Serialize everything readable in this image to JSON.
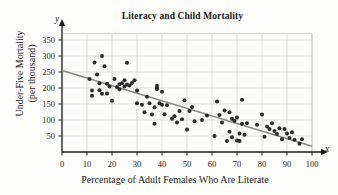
{
  "chart_data": {
    "type": "scatter",
    "title": "Literacy and Child Mortality",
    "xlabel": "Percentage of Adult Females Who Are Literate",
    "ylabel": "Under-Five Mortality",
    "ylabel_line2": "(per thousand)",
    "x_axis_symbol": "x",
    "y_axis_symbol": "y",
    "xlim": [
      0,
      100
    ],
    "ylim": [
      0,
      370
    ],
    "xticks": [
      0,
      10,
      20,
      30,
      40,
      50,
      60,
      70,
      80,
      90,
      100
    ],
    "yticks": [
      50,
      100,
      150,
      200,
      250,
      300,
      350
    ],
    "grid": true,
    "legend": "none",
    "point_color": "#2b2b2b",
    "line_color": "#8b8b8b",
    "trendline": {
      "label": "least-squares regression line",
      "x0": 0,
      "y0": 255,
      "x1": 100,
      "y1": 18
    },
    "points": [
      [
        11,
        228
      ],
      [
        12,
        176
      ],
      [
        12,
        192
      ],
      [
        13,
        280
      ],
      [
        14,
        242
      ],
      [
        15,
        193
      ],
      [
        15,
        215
      ],
      [
        16,
        300
      ],
      [
        16,
        182
      ],
      [
        17,
        268
      ],
      [
        18,
        213
      ],
      [
        18,
        183
      ],
      [
        19,
        205
      ],
      [
        20,
        160
      ],
      [
        21,
        228
      ],
      [
        22,
        203
      ],
      [
        23,
        196
      ],
      [
        23,
        212
      ],
      [
        24,
        215
      ],
      [
        25,
        224
      ],
      [
        25,
        205
      ],
      [
        26,
        279
      ],
      [
        26,
        211
      ],
      [
        27,
        208
      ],
      [
        28,
        216
      ],
      [
        29,
        224
      ],
      [
        30,
        192
      ],
      [
        30,
        152
      ],
      [
        32,
        148
      ],
      [
        33,
        124
      ],
      [
        34,
        173
      ],
      [
        35,
        152
      ],
      [
        36,
        117
      ],
      [
        37,
        88
      ],
      [
        37,
        140
      ],
      [
        38,
        207
      ],
      [
        38,
        200
      ],
      [
        38,
        196
      ],
      [
        39,
        152
      ],
      [
        40,
        188
      ],
      [
        40,
        148
      ],
      [
        41,
        118
      ],
      [
        42,
        146
      ],
      [
        44,
        104
      ],
      [
        45,
        112
      ],
      [
        46,
        92
      ],
      [
        47,
        128
      ],
      [
        48,
        102
      ],
      [
        49,
        162
      ],
      [
        50,
        70
      ],
      [
        51,
        128
      ],
      [
        52,
        141
      ],
      [
        53,
        96
      ],
      [
        56,
        100
      ],
      [
        58,
        114
      ],
      [
        61,
        50
      ],
      [
        62,
        158
      ],
      [
        63,
        116
      ],
      [
        64,
        92
      ],
      [
        65,
        130
      ],
      [
        66,
        34
      ],
      [
        67,
        63
      ],
      [
        67,
        124
      ],
      [
        68,
        46
      ],
      [
        68,
        104
      ],
      [
        69,
        98
      ],
      [
        70,
        36
      ],
      [
        70,
        108
      ],
      [
        71,
        58
      ],
      [
        71,
        34
      ],
      [
        72,
        88
      ],
      [
        72,
        163
      ],
      [
        73,
        54
      ],
      [
        74,
        90
      ],
      [
        78,
        85
      ],
      [
        80,
        117
      ],
      [
        81,
        48
      ],
      [
        82,
        80
      ],
      [
        83,
        72
      ],
      [
        84,
        90
      ],
      [
        85,
        66
      ],
      [
        86,
        56
      ],
      [
        87,
        74
      ],
      [
        88,
        40
      ],
      [
        89,
        72
      ],
      [
        90,
        58
      ],
      [
        91,
        44
      ],
      [
        92,
        62
      ],
      [
        93,
        38
      ],
      [
        95,
        26
      ],
      [
        96,
        40
      ]
    ]
  }
}
